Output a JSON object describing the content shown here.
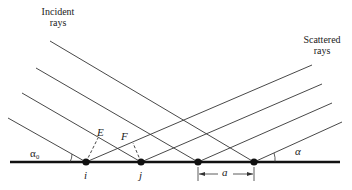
{
  "labels": {
    "incident": [
      "Incident",
      "rays"
    ],
    "scattered": [
      "Scattered",
      "rays"
    ],
    "alpha0": "α₀",
    "alpha": "α",
    "E": "E",
    "F": "F",
    "i": "i",
    "j": "j",
    "a": "a"
  },
  "geometry": {
    "surface": {
      "x1": 10,
      "x2": 340,
      "y": 162
    },
    "atoms_x": [
      86,
      141,
      198,
      254
    ],
    "incident_rays": [
      {
        "x1": 50,
        "y1": 41,
        "x2": 254,
        "y2": 162
      },
      {
        "x1": 36,
        "y1": 68,
        "x2": 198,
        "y2": 162
      },
      {
        "x1": 22,
        "y1": 93,
        "x2": 141,
        "y2": 162
      },
      {
        "x1": 8,
        "y1": 118,
        "x2": 86,
        "y2": 162
      }
    ],
    "scattered_rays": [
      {
        "x1": 86,
        "y1": 162,
        "x2": 312,
        "y2": 65
      },
      {
        "x1": 141,
        "y1": 162,
        "x2": 322,
        "y2": 84
      },
      {
        "x1": 198,
        "y1": 162,
        "x2": 332,
        "y2": 103
      },
      {
        "x1": 254,
        "y1": 162,
        "x2": 342,
        "y2": 122
      }
    ]
  },
  "colors": {
    "line": "#333333",
    "surface": "#111111"
  }
}
